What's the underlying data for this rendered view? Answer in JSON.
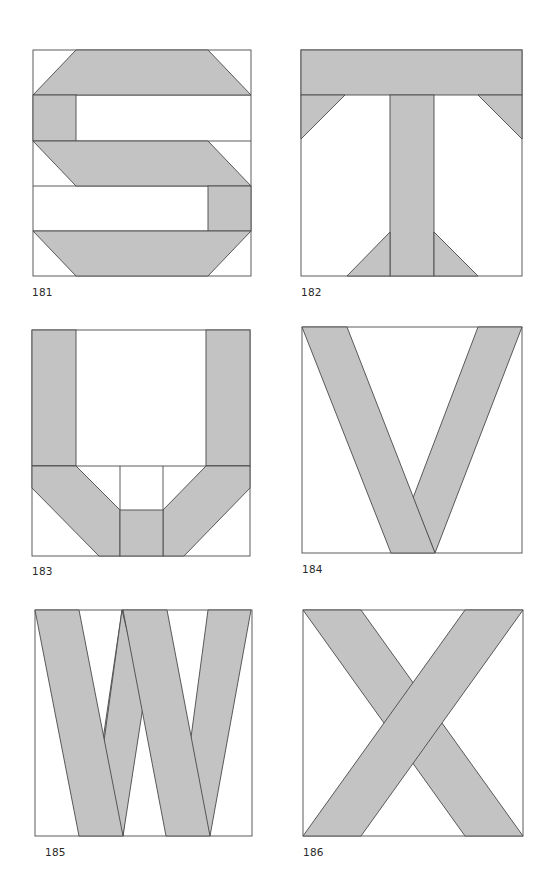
{
  "page": {
    "colors": {
      "fabric": "#c3c3c3",
      "background": "#ffffff",
      "outline": "#4a4a4a"
    }
  },
  "blocks": [
    {
      "number": "181",
      "letter": "S"
    },
    {
      "number": "182",
      "letter": "T"
    },
    {
      "number": "183",
      "letter": "U"
    },
    {
      "number": "184",
      "letter": "V"
    },
    {
      "number": "185",
      "letter": "W"
    },
    {
      "number": "186",
      "letter": "X"
    }
  ]
}
